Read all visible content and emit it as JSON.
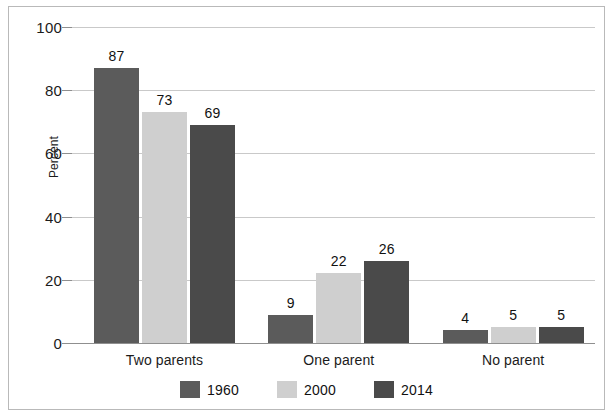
{
  "chart_data": {
    "type": "bar",
    "title": "",
    "subtitle": "",
    "xlabel": "",
    "ylabel": "Percent",
    "ylim": [
      0,
      100
    ],
    "yticks": [
      0,
      20,
      40,
      60,
      80,
      100
    ],
    "ytick_labels": [
      "0",
      "20",
      "40",
      "60",
      "80",
      "100"
    ],
    "grid": "horizontal",
    "legend_position": "bottom-center",
    "categories": [
      "Two parents",
      "One parent",
      "No parent"
    ],
    "series": [
      {
        "name": "1960",
        "color": "#5b5b5b",
        "values": [
          87,
          9,
          4
        ],
        "value_labels": [
          "87",
          "9",
          "4"
        ]
      },
      {
        "name": "2000",
        "color": "#cfcfcf",
        "values": [
          73,
          22,
          5
        ],
        "value_labels": [
          "73",
          "22",
          "5"
        ]
      },
      {
        "name": "2014",
        "color": "#4a4a4a",
        "values": [
          69,
          26,
          5
        ],
        "value_labels": [
          "69",
          "26",
          "5"
        ]
      }
    ],
    "colors": {
      "gridline": "#c9c9c9",
      "axis": "#8f8f8f",
      "text": "#1b1b1b",
      "frame": "#b9b9b9",
      "background": "#ffffff"
    },
    "legend": [
      {
        "label": "1960",
        "color": "#5b5b5b"
      },
      {
        "label": "2000",
        "color": "#cfcfcf"
      },
      {
        "label": "2014",
        "color": "#4a4a4a"
      }
    ]
  }
}
